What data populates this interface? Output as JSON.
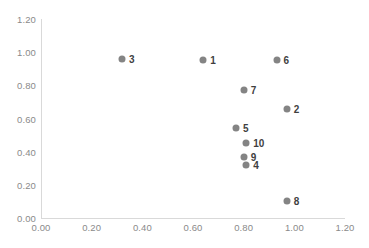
{
  "chart_data": {
    "type": "scatter",
    "title": "",
    "xlabel": "",
    "ylabel": "",
    "xlim": [
      0.0,
      1.2
    ],
    "ylim": [
      0.0,
      1.2
    ],
    "grid": false,
    "legend": "none",
    "marker_color": "#848484",
    "axis_color": "#d9d9d9",
    "tick_label_color": "#8a8a8a",
    "point_label_color": "#3f3f3f",
    "x_ticks": [
      "0.00",
      "0.20",
      "0.40",
      "0.60",
      "0.80",
      "1.00",
      "1.20"
    ],
    "x_tick_values": [
      0.0,
      0.2,
      0.4,
      0.6,
      0.8,
      1.0,
      1.2
    ],
    "y_ticks": [
      "0.00",
      "0.20",
      "0.40",
      "0.60",
      "0.80",
      "1.00",
      "1.20"
    ],
    "y_tick_values": [
      0.0,
      0.2,
      0.4,
      0.6,
      0.8,
      1.0,
      1.2
    ],
    "points": [
      {
        "label": "3",
        "x": 0.32,
        "y": 0.96
      },
      {
        "label": "1",
        "x": 0.64,
        "y": 0.95
      },
      {
        "label": "6",
        "x": 0.93,
        "y": 0.95
      },
      {
        "label": "7",
        "x": 0.8,
        "y": 0.77
      },
      {
        "label": "2",
        "x": 0.97,
        "y": 0.66
      },
      {
        "label": "5",
        "x": 0.77,
        "y": 0.54
      },
      {
        "label": "10",
        "x": 0.81,
        "y": 0.45
      },
      {
        "label": "9",
        "x": 0.8,
        "y": 0.37
      },
      {
        "label": "4",
        "x": 0.81,
        "y": 0.32
      },
      {
        "label": "8",
        "x": 0.97,
        "y": 0.1
      }
    ]
  }
}
